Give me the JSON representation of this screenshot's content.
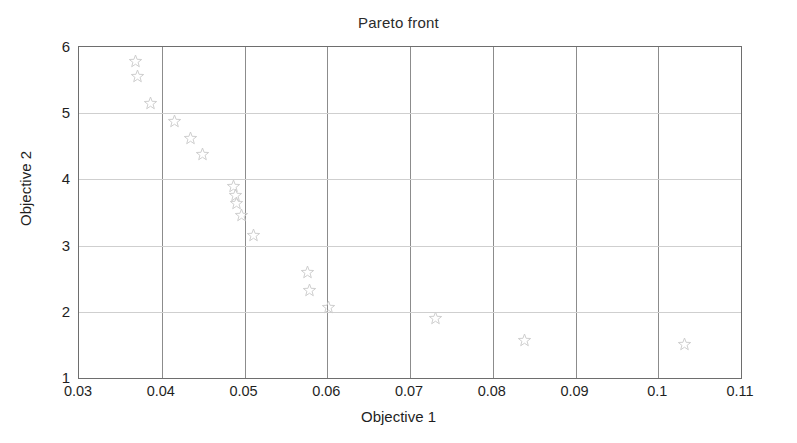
{
  "chart_data": {
    "type": "scatter",
    "title": "Pareto front",
    "xlabel": "Objective 1",
    "ylabel": "Objective 2",
    "xlim": [
      0.03,
      0.11
    ],
    "ylim": [
      1,
      6
    ],
    "grid": true,
    "legend": null,
    "marker": "pentagram-star",
    "marker_color": "#cdcdcd",
    "xticks": [
      "0.03",
      "0.04",
      "0.05",
      "0.06",
      "0.07",
      "0.08",
      "0.09",
      "0.1",
      "0.11"
    ],
    "xtick_values": [
      0.03,
      0.04,
      0.05,
      0.06,
      0.07,
      0.08,
      0.09,
      0.1,
      0.11
    ],
    "yticks": [
      "1",
      "2",
      "3",
      "4",
      "5",
      "6"
    ],
    "ytick_values": [
      1,
      2,
      3,
      4,
      5,
      6
    ],
    "points": [
      {
        "x": 0.0368,
        "y": 5.78
      },
      {
        "x": 0.0371,
        "y": 5.55
      },
      {
        "x": 0.0386,
        "y": 5.15
      },
      {
        "x": 0.0416,
        "y": 4.87
      },
      {
        "x": 0.0435,
        "y": 4.62
      },
      {
        "x": 0.0449,
        "y": 4.37
      },
      {
        "x": 0.0487,
        "y": 3.89
      },
      {
        "x": 0.0489,
        "y": 3.76
      },
      {
        "x": 0.049,
        "y": 3.63
      },
      {
        "x": 0.0496,
        "y": 3.45
      },
      {
        "x": 0.0511,
        "y": 3.15
      },
      {
        "x": 0.0576,
        "y": 2.6
      },
      {
        "x": 0.0578,
        "y": 2.32
      },
      {
        "x": 0.0601,
        "y": 2.06
      },
      {
        "x": 0.0731,
        "y": 1.9
      },
      {
        "x": 0.0838,
        "y": 1.56
      },
      {
        "x": 0.1032,
        "y": 1.5
      }
    ]
  },
  "axes": {
    "frame_color": "#6e6e6e",
    "major_grid_color": "#8c8c8c",
    "minor_grid_color": "#cfcfcf"
  }
}
